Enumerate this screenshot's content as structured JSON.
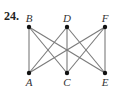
{
  "problem_number": "24.",
  "graph": {
    "type": "complete bipartite K3,3",
    "nodes": [
      {
        "id": "B",
        "label": "B",
        "x": 29,
        "y": 27,
        "label_pos": "above"
      },
      {
        "id": "D",
        "label": "D",
        "x": 67,
        "y": 27,
        "label_pos": "above"
      },
      {
        "id": "F",
        "label": "F",
        "x": 105,
        "y": 27,
        "label_pos": "above"
      },
      {
        "id": "A",
        "label": "A",
        "x": 29,
        "y": 73,
        "label_pos": "below"
      },
      {
        "id": "C",
        "label": "C",
        "x": 67,
        "y": 73,
        "label_pos": "below"
      },
      {
        "id": "E",
        "label": "E",
        "x": 105,
        "y": 73,
        "label_pos": "below"
      }
    ],
    "edges": [
      [
        "B",
        "A"
      ],
      [
        "B",
        "C"
      ],
      [
        "B",
        "E"
      ],
      [
        "D",
        "A"
      ],
      [
        "D",
        "C"
      ],
      [
        "D",
        "E"
      ],
      [
        "F",
        "A"
      ],
      [
        "F",
        "C"
      ],
      [
        "F",
        "E"
      ]
    ],
    "edge_color": "#7a7a7a",
    "node_color": "#111111"
  }
}
